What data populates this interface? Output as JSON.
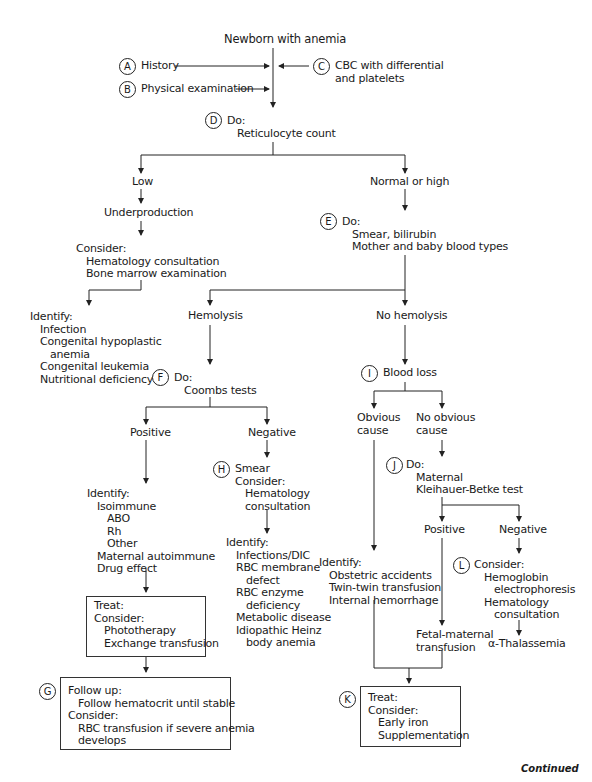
{
  "title": "Newborn with anemia",
  "steps": {
    "A": {
      "label": "A",
      "text": "History"
    },
    "B": {
      "label": "B",
      "text": "Physical examination"
    },
    "C": {
      "label": "C",
      "lines": [
        "CBC with differential",
        "and platelets"
      ]
    },
    "D": {
      "label": "D",
      "lines": [
        "Do:",
        "Reticulocyte count"
      ]
    },
    "E": {
      "label": "E",
      "lines": [
        "Do:",
        "Smear, bilirubin",
        "Mother and baby blood types"
      ]
    },
    "F": {
      "label": "F",
      "lines": [
        "Do:",
        "Coombs tests"
      ]
    },
    "G": {
      "label": "G",
      "lines": [
        "Follow up:",
        "Follow hematocrit until stable",
        "Consider:",
        "RBC transfusion if severe anemia",
        "develops"
      ]
    },
    "H": {
      "label": "H",
      "lines": [
        "Smear",
        "Consider:",
        "Hematology",
        "consultation"
      ]
    },
    "I": {
      "label": "I",
      "text": "Blood loss"
    },
    "J": {
      "label": "J",
      "lines": [
        "Do:",
        "Maternal",
        "Kleihauer-Betke test"
      ]
    },
    "K": {
      "label": "K",
      "lines": [
        "Treat:",
        "Consider:",
        "Early iron",
        "Supplementation"
      ]
    },
    "L": {
      "label": "L",
      "lines": [
        "Consider:",
        "Hemoglobin",
        "electrophoresis",
        "Hematology",
        "consultation"
      ]
    }
  },
  "nodes": {
    "low": "Low",
    "normal_high": "Normal or high",
    "underproduction": "Underproduction",
    "consider_under": [
      "Consider:",
      "Hematology consultation",
      "Bone marrow examination"
    ],
    "identify_under": [
      "Identify:",
      "Infection",
      "Congenital hypoplastic",
      "anemia",
      "Congenital leukemia",
      "Nutritional deficiency"
    ],
    "hemolysis": "Hemolysis",
    "no_hemolysis": "No hemolysis",
    "positive_coombs": "Positive",
    "negative_coombs": "Negative",
    "identify_positive": [
      "Identify:",
      "Isoimmune",
      "ABO",
      "Rh",
      "Other",
      "Maternal autoimmune",
      "Drug effect"
    ],
    "treat_positive": [
      "Treat:",
      "Consider:",
      "Phototherapy",
      "Exchange transfusion"
    ],
    "identify_negative": [
      "Identify:",
      "Infections/DIC",
      "RBC membrane",
      "defect",
      "RBC enzyme",
      "deficiency",
      "Metabolic disease",
      "Idiopathic Heinz",
      "body anemia"
    ],
    "obvious_cause": [
      "Obvious",
      "cause"
    ],
    "no_obvious_cause": [
      "No obvious",
      "cause"
    ],
    "identify_obvious": [
      "Identify:",
      "Obstetric accidents",
      "Twin-twin transfusion",
      "Internal hemorrhage"
    ],
    "positive_kb": "Positive",
    "negative_kb": "Negative",
    "fetal_maternal": [
      "Fetal-maternal",
      "transfusion"
    ],
    "thalassemia": "α-Thalassemia"
  },
  "footer": "Continued"
}
